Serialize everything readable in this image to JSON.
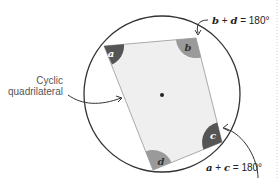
{
  "diagram": {
    "title": "Cyclic quadrilateral",
    "label_line1": "Cyclic",
    "label_line2": "quadrilateral",
    "angles": [
      {
        "name": "a",
        "shade": "#555555",
        "text_color": "#ffffff"
      },
      {
        "name": "b",
        "shade": "#9a9a9a",
        "text_color": "#333333"
      },
      {
        "name": "c",
        "shade": "#555555",
        "text_color": "#ffffff"
      },
      {
        "name": "d",
        "shade": "#9a9a9a",
        "text_color": "#333333"
      }
    ],
    "equation_bd": {
      "lhs1": "b",
      "op": " + ",
      "lhs2": "d",
      "rhs": " = 180°"
    },
    "equation_ac": {
      "lhs1": "a",
      "op": " + ",
      "lhs2": "c",
      "rhs": " = 180°"
    },
    "colors": {
      "circle": "#333333",
      "quad_fill": "#efefef",
      "quad_edge": "#aaaaaa",
      "center_dot": "#222222"
    }
  }
}
